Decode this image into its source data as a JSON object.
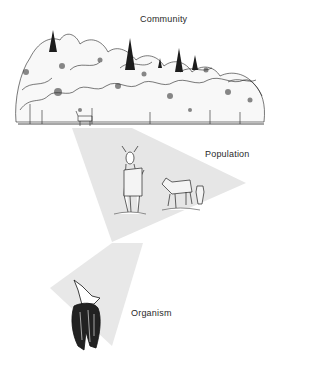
{
  "diagram": {
    "levels": [
      {
        "name": "community",
        "label": "Community"
      },
      {
        "name": "population",
        "label": "Population"
      },
      {
        "name": "organism",
        "label": "Organism"
      }
    ],
    "colors": {
      "beam": "#e6e6e6",
      "ink": "#1a1a1a",
      "background": "#ffffff"
    }
  }
}
